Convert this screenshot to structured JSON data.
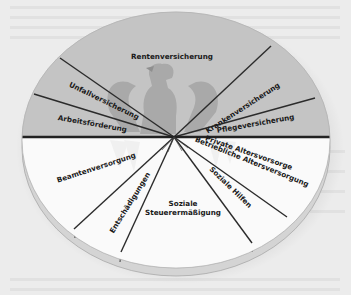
{
  "diagram": {
    "type": "segmented-disk",
    "colors": {
      "page_background": "#ececec",
      "upper_half": "#c4c4c4",
      "lower_half": "#fafafa",
      "rim": "#d9d9d9",
      "divider_lines": "#2b2b2b",
      "eagle": "#a9a9a9"
    },
    "upper_segments": [
      {
        "id": "rentenversicherung",
        "label": "Rentenversicherung"
      },
      {
        "id": "krankenversicherung",
        "label": "Krankenversicherung"
      },
      {
        "id": "pflegeversicherung",
        "label": "Pflegeversicherung"
      },
      {
        "id": "unfallversicherung",
        "label": "Unfallversicherung"
      },
      {
        "id": "arbeitsfoerderung",
        "label": "Arbeitsförderung"
      }
    ],
    "lower_segments": [
      {
        "id": "private-altersvorsorge",
        "label": "Private Altersvorsorge"
      },
      {
        "id": "betriebliche-altersversorgung",
        "label": "Betriebliche Altersversorgung"
      },
      {
        "id": "soziale-hilfen",
        "label": "Soziale Hilfen"
      },
      {
        "id": "soziale-steuerermaessigung",
        "label_line1": "Soziale",
        "label_line2": "Steuerermäßigung"
      },
      {
        "id": "entschaedigungen",
        "label": "Entschädigungen"
      },
      {
        "id": "beamtenversorgung",
        "label": "Beamtenversorgung"
      }
    ]
  }
}
